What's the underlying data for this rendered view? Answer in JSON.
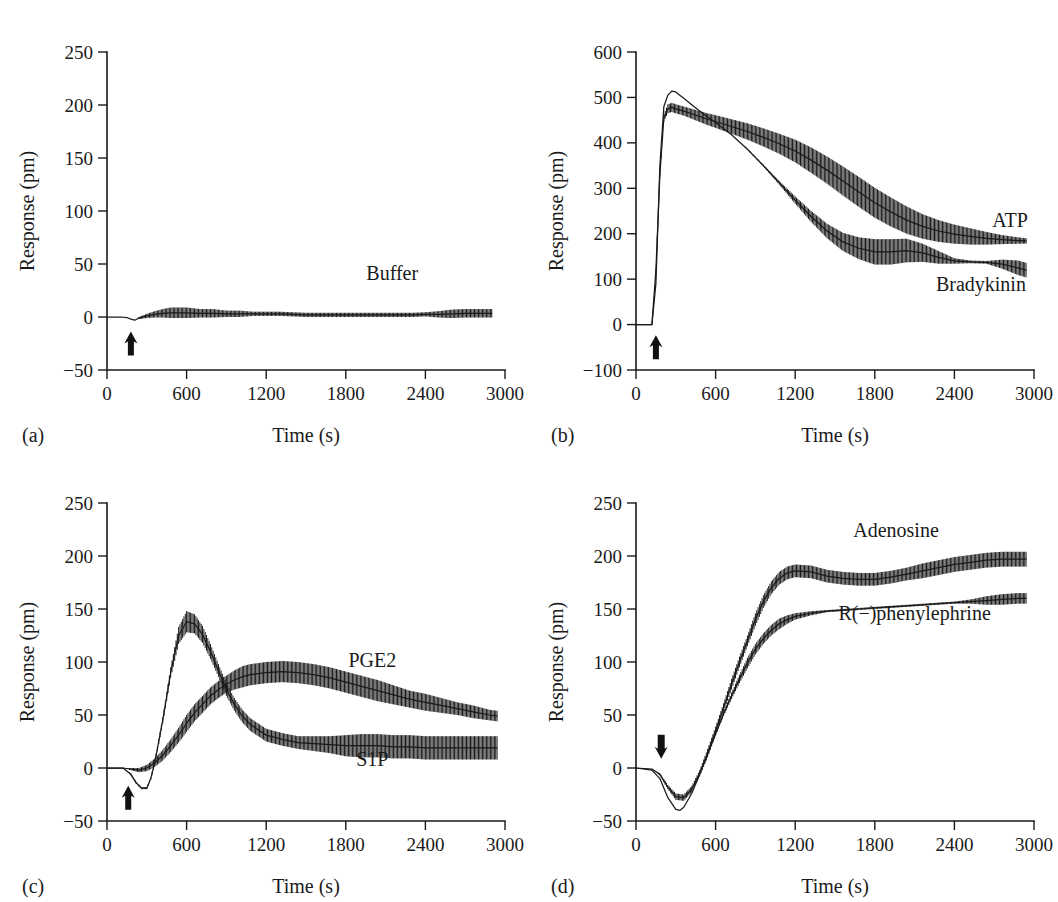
{
  "figure": {
    "axis_title_y": "Response (pm)",
    "axis_title_x": "Time (s)"
  },
  "panels": [
    {
      "letter": "(a)",
      "ylabel": "Response (pm)",
      "xlabel": "Time (s)",
      "yticks": [
        "250",
        "200",
        "150",
        "100",
        "50",
        "0",
        "-50"
      ],
      "xticks": [
        "0",
        "600",
        "1200",
        "1800",
        "2400",
        "3000"
      ],
      "arrow": "up-arrow-marker",
      "series_labels": [
        "Buffer"
      ]
    },
    {
      "letter": "(b)",
      "ylabel": "Response (pm)",
      "xlabel": "Time (s)",
      "yticks": [
        "600",
        "500",
        "400",
        "300",
        "200",
        "100",
        "0",
        "-100"
      ],
      "xticks": [
        "0",
        "600",
        "1200",
        "1800",
        "2400",
        "3000"
      ],
      "arrow": "up-arrow-marker",
      "series_labels": [
        "ATP",
        "Bradykinin"
      ]
    },
    {
      "letter": "(c)",
      "ylabel": "Response (pm)",
      "xlabel": "Time (s)",
      "yticks": [
        "250",
        "200",
        "150",
        "100",
        "50",
        "0",
        "-50"
      ],
      "xticks": [
        "0",
        "600",
        "1200",
        "1800",
        "2400",
        "3000"
      ],
      "arrow": "up-arrow-marker",
      "series_labels": [
        "PGE2",
        "S1P"
      ]
    },
    {
      "letter": "(d)",
      "ylabel": "Response (pm)",
      "xlabel": "Time (s)",
      "yticks": [
        "250",
        "200",
        "150",
        "100",
        "50",
        "0",
        "-50"
      ],
      "xticks": [
        "0",
        "600",
        "1200",
        "1800",
        "2400",
        "3000"
      ],
      "arrow": "down-arrow-marker",
      "series_labels": [
        "Adenosine",
        "R(−)phenylephrine"
      ]
    }
  ],
  "chart_data": [
    {
      "type": "line",
      "panel": "(a)",
      "title": "",
      "xlabel": "Time (s)",
      "ylabel": "Response (pm)",
      "xlim": [
        0,
        3000
      ],
      "ylim": [
        -50,
        250
      ],
      "xticks": [
        0,
        600,
        1200,
        1800,
        2400,
        3000
      ],
      "yticks": [
        -50,
        0,
        50,
        100,
        150,
        200,
        250
      ],
      "grid": false,
      "legend": "inline-labels",
      "annotations": [
        {
          "text": "Buffer",
          "x": 2150,
          "y": 35
        },
        {
          "text": "addition arrow",
          "x": 180,
          "y": -25,
          "type": "up-arrow"
        }
      ],
      "series": [
        {
          "name": "Buffer",
          "has_error_bars": true,
          "x": [
            0,
            100,
            150,
            180,
            210,
            240,
            300,
            360,
            420,
            480,
            540,
            600,
            700,
            800,
            900,
            1000,
            1100,
            1200,
            1300,
            1400,
            1500,
            1600,
            1700,
            1800,
            1900,
            2000,
            2100,
            2200,
            2300,
            2400,
            2500,
            2600,
            2700,
            2800,
            2900
          ],
          "y": [
            0,
            0,
            -0.5,
            -2,
            -3,
            -1,
            1,
            2.5,
            3.5,
            4,
            4,
            4,
            3.5,
            3.5,
            3,
            3,
            3,
            3,
            3,
            2.5,
            2,
            2,
            2,
            2,
            2,
            2,
            2,
            2,
            2,
            2.5,
            2.5,
            3,
            3.5,
            3.5,
            3.5
          ],
          "yerr": [
            0,
            0,
            0,
            0,
            0,
            1,
            2,
            3,
            4,
            5,
            5,
            5,
            4,
            4,
            3,
            3,
            2,
            2,
            2,
            2,
            2,
            2,
            2,
            2,
            2,
            2,
            2,
            2,
            2,
            2,
            3,
            4,
            4,
            4,
            4
          ]
        }
      ]
    },
    {
      "type": "line",
      "panel": "(b)",
      "title": "",
      "xlabel": "Time (s)",
      "ylabel": "Response (pm)",
      "xlim": [
        0,
        3000
      ],
      "ylim": [
        -100,
        600
      ],
      "xticks": [
        0,
        600,
        1200,
        1800,
        2400,
        3000
      ],
      "yticks": [
        -100,
        0,
        100,
        200,
        300,
        400,
        500,
        600
      ],
      "grid": false,
      "legend": "inline-labels",
      "annotations": [
        {
          "text": "ATP",
          "x": 2820,
          "y": 215
        },
        {
          "text": "Bradykinin",
          "x": 2600,
          "y": 75
        },
        {
          "text": "addition arrow",
          "x": 150,
          "y": -50,
          "type": "up-arrow"
        }
      ],
      "series": [
        {
          "name": "ATP",
          "has_error_bars": true,
          "x": [
            0,
            120,
            150,
            180,
            210,
            240,
            270,
            300,
            360,
            420,
            480,
            540,
            600,
            720,
            840,
            960,
            1080,
            1200,
            1320,
            1440,
            1560,
            1680,
            1800,
            1920,
            2040,
            2160,
            2280,
            2400,
            2520,
            2640,
            2760,
            2880,
            2940
          ],
          "y": [
            0,
            0,
            120,
            330,
            455,
            475,
            478,
            475,
            470,
            464,
            458,
            452,
            447,
            436,
            425,
            412,
            398,
            382,
            362,
            340,
            316,
            292,
            268,
            248,
            230,
            216,
            206,
            199,
            194,
            190,
            187,
            185,
            184
          ],
          "yerr": [
            0,
            0,
            2,
            4,
            8,
            10,
            10,
            10,
            10,
            11,
            12,
            13,
            14,
            16,
            18,
            20,
            22,
            25,
            28,
            30,
            32,
            33,
            33,
            32,
            30,
            27,
            24,
            21,
            18,
            14,
            10,
            7,
            6
          ]
        },
        {
          "name": "Bradykinin",
          "has_error_bars": true,
          "x": [
            0,
            120,
            150,
            180,
            210,
            240,
            270,
            300,
            330,
            360,
            420,
            480,
            540,
            600,
            720,
            840,
            960,
            1080,
            1200,
            1320,
            1440,
            1560,
            1680,
            1800,
            1920,
            2040,
            2160,
            2280,
            2400,
            2520,
            2640,
            2760,
            2880,
            2940
          ],
          "y": [
            0,
            0,
            90,
            350,
            480,
            505,
            514,
            512,
            505,
            498,
            484,
            470,
            457,
            445,
            418,
            386,
            350,
            312,
            274,
            238,
            206,
            182,
            168,
            160,
            160,
            163,
            158,
            148,
            140,
            138,
            137,
            133,
            125,
            120
          ],
          "yerr": [
            0,
            0,
            0,
            0,
            0,
            0,
            0,
            0,
            0,
            0,
            0,
            0,
            0,
            0,
            0,
            1,
            2,
            4,
            8,
            12,
            16,
            20,
            24,
            28,
            28,
            26,
            20,
            14,
            6,
            3,
            3,
            10,
            16,
            16
          ]
        }
      ]
    },
    {
      "type": "line",
      "panel": "(c)",
      "title": "",
      "xlabel": "Time (s)",
      "ylabel": "Response (pm)",
      "xlim": [
        0,
        3000
      ],
      "ylim": [
        -50,
        250
      ],
      "xticks": [
        0,
        600,
        1200,
        1800,
        2400,
        3000
      ],
      "yticks": [
        -50,
        0,
        50,
        100,
        150,
        200,
        250
      ],
      "grid": false,
      "legend": "inline-labels",
      "annotations": [
        {
          "text": "PGE2",
          "x": 2000,
          "y": 95
        },
        {
          "text": "S1P",
          "x": 2000,
          "y": 2
        },
        {
          "text": "addition arrow",
          "x": 160,
          "y": -28,
          "type": "up-arrow"
        }
      ],
      "series": [
        {
          "name": "PGE2",
          "has_error_bars": true,
          "x": [
            0,
            120,
            180,
            240,
            300,
            360,
            420,
            480,
            540,
            600,
            660,
            720,
            780,
            840,
            900,
            960,
            1020,
            1080,
            1140,
            1200,
            1320,
            1440,
            1560,
            1680,
            1800,
            1920,
            2040,
            2160,
            2280,
            2400,
            2520,
            2640,
            2760,
            2880,
            2940
          ],
          "y": [
            0,
            0,
            -1,
            -2,
            0,
            5,
            12,
            21,
            31,
            42,
            52,
            60,
            68,
            74,
            79,
            83,
            86,
            88,
            89,
            90,
            91,
            90,
            88,
            85,
            81,
            77,
            73,
            69,
            65,
            62,
            59,
            56,
            53,
            50,
            49
          ],
          "yerr": [
            0,
            0,
            1,
            2,
            3,
            4,
            5,
            6,
            7,
            8,
            8,
            8,
            8,
            8,
            8,
            9,
            10,
            10,
            10,
            10,
            10,
            10,
            10,
            10,
            10,
            10,
            10,
            9,
            8,
            8,
            7,
            6,
            6,
            5,
            5
          ]
        },
        {
          "name": "S1P",
          "has_error_bars": true,
          "x": [
            0,
            120,
            180,
            220,
            260,
            300,
            330,
            360,
            420,
            480,
            540,
            600,
            660,
            720,
            780,
            840,
            900,
            960,
            1020,
            1080,
            1200,
            1320,
            1440,
            1560,
            1680,
            1800,
            1920,
            2040,
            2160,
            2280,
            2400,
            2520,
            2640,
            2760,
            2880,
            2940
          ],
          "y": [
            0,
            0,
            -6,
            -14,
            -19,
            -19,
            -10,
            5,
            45,
            90,
            125,
            138,
            136,
            126,
            110,
            92,
            74,
            60,
            49,
            41,
            31,
            27,
            24,
            23,
            22,
            21,
            21,
            21,
            20,
            20,
            19,
            19,
            19,
            19,
            19,
            19
          ],
          "yerr": [
            0,
            0,
            1,
            1,
            1,
            1,
            1,
            2,
            3,
            5,
            8,
            10,
            9,
            8,
            7,
            6,
            6,
            6,
            6,
            6,
            6,
            6,
            6,
            7,
            8,
            10,
            11,
            11,
            11,
            11,
            11,
            11,
            11,
            11,
            11,
            11
          ]
        }
      ]
    },
    {
      "type": "line",
      "panel": "(d)",
      "title": "",
      "xlabel": "Time (s)",
      "ylabel": "Response (pm)",
      "xlim": [
        0,
        3000
      ],
      "ylim": [
        -50,
        250
      ],
      "xticks": [
        0,
        600,
        1200,
        1800,
        2400,
        3000
      ],
      "yticks": [
        -50,
        0,
        50,
        100,
        150,
        200,
        250
      ],
      "grid": false,
      "legend": "inline-labels",
      "annotations": [
        {
          "text": "Adenosine",
          "x": 1960,
          "y": 218
        },
        {
          "text": "R(−)phenylephrine",
          "x": 2100,
          "y": 140
        },
        {
          "text": "addition arrow",
          "x": 190,
          "y": 20,
          "type": "down-arrow"
        }
      ],
      "series": [
        {
          "name": "Adenosine",
          "has_error_bars": true,
          "x": [
            0,
            120,
            180,
            240,
            300,
            360,
            420,
            480,
            540,
            600,
            660,
            720,
            780,
            840,
            900,
            960,
            1020,
            1080,
            1140,
            1200,
            1320,
            1440,
            1560,
            1680,
            1800,
            1920,
            2040,
            2160,
            2280,
            2400,
            2520,
            2640,
            2760,
            2880,
            2940
          ],
          "y": [
            0,
            -1,
            -6,
            -18,
            -27,
            -28,
            -20,
            -5,
            14,
            35,
            57,
            79,
            100,
            120,
            140,
            157,
            170,
            179,
            184,
            186,
            185,
            181,
            179,
            178,
            178,
            180,
            183,
            186,
            189,
            192,
            194,
            196,
            197,
            197,
            197
          ],
          "yerr": [
            0,
            0,
            1,
            2,
            3,
            3,
            3,
            3,
            4,
            4,
            4,
            5,
            5,
            5,
            6,
            6,
            6,
            6,
            6,
            6,
            6,
            6,
            6,
            6,
            6,
            6,
            6,
            7,
            7,
            7,
            7,
            7,
            7,
            7,
            7
          ]
        },
        {
          "name": "R(−)phenylephrine",
          "has_error_bars": true,
          "x": [
            0,
            120,
            180,
            240,
            300,
            330,
            360,
            420,
            480,
            540,
            600,
            660,
            720,
            780,
            840,
            900,
            960,
            1020,
            1080,
            1140,
            1200,
            1320,
            1440,
            1560,
            1680,
            1800,
            1920,
            2040,
            2160,
            2280,
            2400,
            2520,
            2640,
            2760,
            2880,
            2940
          ],
          "y": [
            0,
            -2,
            -10,
            -28,
            -39,
            -40,
            -37,
            -24,
            -6,
            13,
            32,
            51,
            68,
            84,
            99,
            112,
            122,
            130,
            136,
            140,
            143,
            146,
            148,
            149,
            150,
            151,
            152,
            153,
            154,
            155,
            156,
            157,
            158,
            159,
            160,
            160
          ],
          "yerr": [
            0,
            0,
            0,
            0,
            0,
            0,
            0,
            0,
            0,
            0,
            1,
            2,
            3,
            4,
            5,
            5,
            5,
            5,
            5,
            4,
            3,
            2,
            1,
            1,
            1,
            1,
            1,
            1,
            1,
            1,
            1,
            2,
            4,
            5,
            5,
            5
          ]
        }
      ]
    }
  ]
}
